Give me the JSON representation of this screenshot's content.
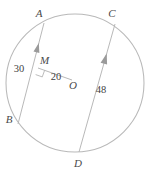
{
  "figure": {
    "type": "circle-geometry-diagram",
    "circle": {
      "center_label": "O",
      "center_x": 75,
      "center_y": 83,
      "radius": 69
    },
    "points": [
      {
        "name": "A",
        "label": "A",
        "x": 44,
        "y": 23,
        "label_x": 39,
        "label_y": 17
      },
      {
        "name": "C",
        "label": "C",
        "x": 115,
        "y": 24,
        "label_x": 112,
        "label_y": 17
      },
      {
        "name": "M",
        "label": "M",
        "x": 38,
        "y": 68,
        "label_x": 40,
        "label_y": 64
      },
      {
        "name": "B",
        "label": "B",
        "x": 18,
        "y": 124,
        "label_x": 9,
        "label_y": 123
      },
      {
        "name": "D",
        "label": "D",
        "x": 79,
        "y": 152,
        "label_x": 78,
        "label_y": 167
      },
      {
        "name": "O",
        "label": "O",
        "x": 72,
        "y": 80,
        "label_x": 73,
        "label_y": 89
      }
    ],
    "segments": [
      {
        "name": "chord-AB",
        "from": "A",
        "to": "B",
        "tick_count": 1
      },
      {
        "name": "chord-CD",
        "from": "C",
        "to": "D",
        "tick_count": 1
      },
      {
        "name": "radius-OM",
        "from": "O",
        "to": "M",
        "tick_count": 0
      }
    ],
    "measures": [
      {
        "name": "chord-ab-length",
        "value": "30",
        "x": 19,
        "y": 72
      },
      {
        "name": "om-distance",
        "value": "20",
        "x": 56,
        "y": 80
      },
      {
        "name": "chord-cd-length",
        "value": "48",
        "x": 101,
        "y": 93
      }
    ],
    "right_angle": {
      "name": "right-angle-at-m",
      "at_point": "M",
      "size": 7
    },
    "colors": {
      "stroke": "#b4b4b4",
      "label": "#4a4a4a",
      "measure": "#3f3f3f",
      "background": "#ffffff"
    }
  }
}
